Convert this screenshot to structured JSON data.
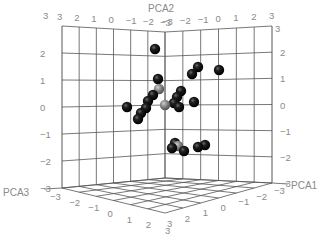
{
  "chart_data": {
    "type": "scatter3d",
    "title": "",
    "axes": {
      "x": {
        "label": "PCA1",
        "range": [
          -3,
          3
        ],
        "ticks": [
          -3,
          -2,
          -1,
          0,
          1,
          2,
          3
        ]
      },
      "y": {
        "label": "PCA2",
        "range": [
          -3,
          3
        ],
        "ticks": [
          -3,
          -2,
          -1,
          0,
          1,
          2,
          3
        ]
      },
      "z": {
        "label": "PCA3",
        "range": [
          -3,
          3
        ],
        "ticks": [
          -3,
          -2,
          -1,
          0,
          1,
          2,
          3
        ]
      }
    },
    "grid": true,
    "legend": null,
    "colors": {
      "primary": "#111111",
      "highlight": "#8c8c8c"
    },
    "points_screen": [
      {
        "px": 155,
        "py": 49,
        "group": "black"
      },
      {
        "px": 198,
        "py": 67,
        "group": "black"
      },
      {
        "px": 192,
        "py": 74,
        "group": "black"
      },
      {
        "px": 219,
        "py": 70,
        "group": "black"
      },
      {
        "px": 158,
        "py": 79,
        "group": "black"
      },
      {
        "px": 159,
        "py": 89,
        "group": "grey"
      },
      {
        "px": 153,
        "py": 95,
        "group": "black"
      },
      {
        "px": 148,
        "py": 101,
        "group": "black"
      },
      {
        "px": 146,
        "py": 108,
        "group": "black"
      },
      {
        "px": 141,
        "py": 113,
        "group": "black"
      },
      {
        "px": 138,
        "py": 119,
        "group": "black"
      },
      {
        "px": 127,
        "py": 107,
        "group": "black"
      },
      {
        "px": 165,
        "py": 105,
        "group": "grey"
      },
      {
        "px": 181,
        "py": 91,
        "group": "black"
      },
      {
        "px": 177,
        "py": 97,
        "group": "black"
      },
      {
        "px": 174,
        "py": 103,
        "group": "black"
      },
      {
        "px": 179,
        "py": 107,
        "group": "black"
      },
      {
        "px": 194,
        "py": 102,
        "group": "black"
      },
      {
        "px": 175,
        "py": 143,
        "group": "black"
      },
      {
        "px": 172,
        "py": 148,
        "group": "black"
      },
      {
        "px": 178,
        "py": 146,
        "group": "grey"
      },
      {
        "px": 184,
        "py": 151,
        "group": "black"
      },
      {
        "px": 198,
        "py": 147,
        "group": "black"
      },
      {
        "px": 205,
        "py": 145,
        "group": "black"
      }
    ]
  },
  "labels": {
    "pca1": "PCA1",
    "pca2": "PCA2",
    "pca3": "PCA3",
    "top_left_ticks": [
      "3",
      "2",
      "1",
      "0",
      "−1",
      "−2",
      "−3"
    ],
    "top_right_ticks": [
      "−3",
      "−2",
      "−1",
      "0",
      "1",
      "2",
      "3"
    ],
    "left_vticks": [
      "3",
      "2",
      "1",
      "0",
      "−1",
      "−2",
      "−3"
    ],
    "right_vticks": [
      "3",
      "2",
      "1",
      "0",
      "−1",
      "−2",
      "−3"
    ],
    "bottom_left_ticks": [
      "−3",
      "−2",
      "−1",
      "0",
      "1",
      "2",
      "3"
    ],
    "bottom_right_ticks": [
      "3",
      "2",
      "1",
      "0",
      "−1",
      "−2",
      "−3"
    ],
    "corner_top_left": "3",
    "corner_top_right": "3",
    "corner_bottom_left": "−3",
    "corner_bottom_right": "−3"
  }
}
